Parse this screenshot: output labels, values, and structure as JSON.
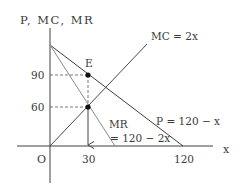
{
  "diagram": {
    "y_axis_label": "P, MC, MR",
    "x_axis_label": "x",
    "origin_label": "O",
    "y_ticks": [
      {
        "label": "90",
        "value": 90
      },
      {
        "label": "60",
        "value": 60
      }
    ],
    "x_ticks": [
      {
        "label": "30",
        "value": 30
      },
      {
        "label": "120",
        "value": 120
      }
    ],
    "curves": {
      "mc": {
        "label": "MC = 2x",
        "equation": "MC = 2x"
      },
      "demand": {
        "label": "P = 120 − x",
        "equation": "P = 120 - x"
      },
      "mr": {
        "label_line1": "MR",
        "label_line2": "= 120 − 2x",
        "equation": "MR = 120 - 2x"
      }
    },
    "points": {
      "e": {
        "label": "E",
        "x": 30,
        "y": 90
      },
      "mc_mr": {
        "x": 30,
        "y": 60
      }
    },
    "colors": {
      "axis": "#404040",
      "demand": "#3c3c3c",
      "mr": "#8a8a8a",
      "mc": "#4a4a4a",
      "guide": "#555555",
      "point": "#111111",
      "text": "#3a3a3a"
    }
  }
}
